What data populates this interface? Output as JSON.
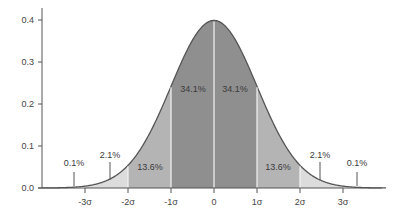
{
  "chart_data": {
    "type": "area",
    "title": "",
    "xlabel": "",
    "ylabel": "",
    "ylim": [
      0,
      0.42
    ],
    "xlim": [
      -4,
      4
    ],
    "grid": false,
    "y_ticks": [
      "0.0",
      "0.1",
      "0.2",
      "0.3",
      "0.4"
    ],
    "y_tick_values": [
      0.0,
      0.1,
      0.2,
      0.3,
      0.4
    ],
    "x_ticks": [
      "-3σ",
      "-2σ",
      "-1σ",
      "0",
      "1σ",
      "2σ",
      "3σ"
    ],
    "x_tick_values": [
      -3,
      -2,
      -1,
      0,
      1,
      2,
      3
    ],
    "curve": "standard normal pdf",
    "regions": [
      {
        "from": -4,
        "to": -3,
        "label": "0.1%",
        "value": 0.1,
        "color": "#ffffff"
      },
      {
        "from": -3,
        "to": -2,
        "label": "2.1%",
        "value": 2.1,
        "color": "#dcdcdc"
      },
      {
        "from": -2,
        "to": -1,
        "label": "13.6%",
        "value": 13.6,
        "color": "#b4b4b4"
      },
      {
        "from": -1,
        "to": 0,
        "label": "34.1%",
        "value": 34.1,
        "color": "#8f8f8f"
      },
      {
        "from": 0,
        "to": 1,
        "label": "34.1%",
        "value": 34.1,
        "color": "#8f8f8f"
      },
      {
        "from": 1,
        "to": 2,
        "label": "13.6%",
        "value": 13.6,
        "color": "#b4b4b4"
      },
      {
        "from": 2,
        "to": 3,
        "label": "2.1%",
        "value": 2.1,
        "color": "#dcdcdc"
      },
      {
        "from": 3,
        "to": 4,
        "label": "0.1%",
        "value": 0.1,
        "color": "#ffffff"
      }
    ]
  }
}
